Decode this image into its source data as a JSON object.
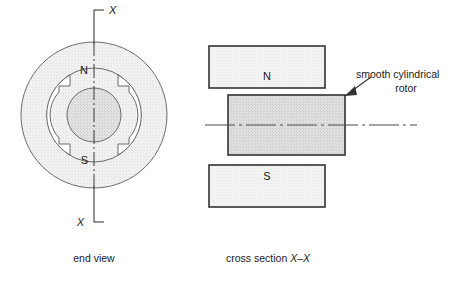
{
  "figure": {
    "colors": {
      "stroke": "#4a4a4a",
      "stroke_dark": "#333333",
      "stator_fill": "#f0f0f0",
      "pole_ring_fill": "#f0f0f0",
      "rotor_fill": "#dcdcdc",
      "magnet_fill": "#efefef",
      "rotor_rect_fill": "#dedede",
      "slot_fill": "#ffffff",
      "text": "#1a1a1a",
      "background": "#ffffff"
    }
  },
  "end_view": {
    "caption": "end view",
    "north_label": "N",
    "south_label": "S",
    "section_mark_top": "X",
    "section_mark_bottom": "X",
    "geometry": {
      "center_x": 94,
      "center_y": 115,
      "outer_radius": 73,
      "pole_ring_radius": 47,
      "rotor_radius": 27
    }
  },
  "cross_section": {
    "caption_prefix": "cross section ",
    "caption_section": "X–X",
    "north_label": "N",
    "south_label": "S",
    "annotation_line1": "smooth cylindrical",
    "annotation_line2": "rotor"
  }
}
